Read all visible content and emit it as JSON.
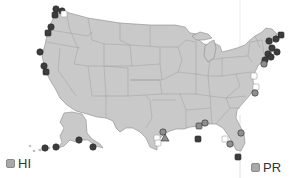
{
  "map": {
    "type": "US coastal station map",
    "land_color": "#c9c9c9",
    "border_color": "#8a8a8a",
    "marker_colors": {
      "dark": "#3d3d3d",
      "medium": "#8f8f8f",
      "open": "#ffffff"
    },
    "insets": [
      {
        "label": "HI",
        "swatch_color": "#a9a9a9"
      },
      {
        "label": "PR",
        "swatch_color": "#a9a9a9"
      }
    ],
    "markers": [
      {
        "x": 56,
        "y": 9,
        "shape": "circle",
        "tone": "dark"
      },
      {
        "x": 62,
        "y": 11,
        "shape": "circle",
        "tone": "dark"
      },
      {
        "x": 55,
        "y": 15,
        "shape": "square",
        "tone": "dark"
      },
      {
        "x": 64,
        "y": 14,
        "shape": "square",
        "tone": "open"
      },
      {
        "x": 51,
        "y": 27,
        "shape": "circle",
        "tone": "dark"
      },
      {
        "x": 48,
        "y": 33,
        "shape": "square",
        "tone": "dark"
      },
      {
        "x": 40,
        "y": 52,
        "shape": "circle",
        "tone": "dark"
      },
      {
        "x": 44,
        "y": 66,
        "shape": "circle",
        "tone": "dark"
      },
      {
        "x": 46,
        "y": 72,
        "shape": "square",
        "tone": "dark"
      },
      {
        "x": 281,
        "y": 35,
        "shape": "square",
        "tone": "dark"
      },
      {
        "x": 276,
        "y": 39,
        "shape": "circle",
        "tone": "dark"
      },
      {
        "x": 269,
        "y": 41,
        "shape": "circle",
        "tone": "dark"
      },
      {
        "x": 272,
        "y": 48,
        "shape": "circle",
        "tone": "dark"
      },
      {
        "x": 268,
        "y": 54,
        "shape": "circle",
        "tone": "dark"
      },
      {
        "x": 277,
        "y": 52,
        "shape": "circle",
        "tone": "dark"
      },
      {
        "x": 271,
        "y": 57,
        "shape": "circle",
        "tone": "dark"
      },
      {
        "x": 265,
        "y": 60,
        "shape": "circle",
        "tone": "dark"
      },
      {
        "x": 264,
        "y": 64,
        "shape": "circle",
        "tone": "medium"
      },
      {
        "x": 254,
        "y": 76,
        "shape": "square",
        "tone": "open"
      },
      {
        "x": 256,
        "y": 87,
        "shape": "square",
        "tone": "open"
      },
      {
        "x": 255,
        "y": 93,
        "shape": "circle",
        "tone": "medium"
      },
      {
        "x": 45,
        "y": 148,
        "shape": "circle",
        "tone": "dark"
      },
      {
        "x": 56,
        "y": 147,
        "shape": "circle",
        "tone": "dark"
      },
      {
        "x": 79,
        "y": 140,
        "shape": "circle",
        "tone": "dark"
      },
      {
        "x": 93,
        "y": 147,
        "shape": "circle",
        "tone": "dark"
      },
      {
        "x": 163,
        "y": 132,
        "shape": "circle",
        "tone": "medium"
      },
      {
        "x": 165,
        "y": 138,
        "shape": "triangle",
        "tone": "medium"
      },
      {
        "x": 157,
        "y": 138,
        "shape": "square",
        "tone": "open"
      },
      {
        "x": 158,
        "y": 143,
        "shape": "square",
        "tone": "open"
      },
      {
        "x": 199,
        "y": 126,
        "shape": "square",
        "tone": "medium"
      },
      {
        "x": 198,
        "y": 139,
        "shape": "square",
        "tone": "dark"
      },
      {
        "x": 205,
        "y": 123,
        "shape": "circle",
        "tone": "medium"
      },
      {
        "x": 225,
        "y": 139,
        "shape": "square",
        "tone": "open"
      },
      {
        "x": 230,
        "y": 144,
        "shape": "circle",
        "tone": "medium"
      },
      {
        "x": 241,
        "y": 133,
        "shape": "circle",
        "tone": "medium"
      },
      {
        "x": 238,
        "y": 157,
        "shape": "square",
        "tone": "dark"
      }
    ]
  }
}
